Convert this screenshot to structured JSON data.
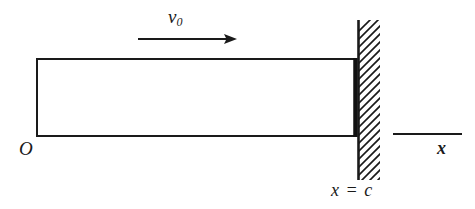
{
  "figure": {
    "width": 475,
    "height": 209,
    "background_color": "#ffffff",
    "line_color": "#1a1a1a"
  },
  "labels": {
    "velocity_symbol": "v",
    "velocity_subscript": "0",
    "origin": "O",
    "wall_position": "x = c",
    "axis_x": "x"
  },
  "geometry": {
    "bar": {
      "left": 37,
      "top": 59,
      "right": 356,
      "bottom": 136,
      "stroke_width": 2,
      "right_edge_stroke_width": 4,
      "fill": "#ffffff"
    },
    "wall": {
      "x": 358,
      "top": 20,
      "bottom": 180,
      "stroke_width": 3,
      "hatch_direction": "lower-left-to-upper-right",
      "hatch_spacing": 8,
      "hatch_length": 20,
      "hatch_stroke_width": 1.6
    },
    "velocity_arrow": {
      "x_start": 138,
      "x_end": 237,
      "y": 39,
      "stroke_width": 2.2,
      "head_length": 13,
      "head_half_width": 5
    },
    "axis_segment": {
      "x_start": 393,
      "x_end": 462,
      "y": 134,
      "stroke_width": 2
    }
  }
}
